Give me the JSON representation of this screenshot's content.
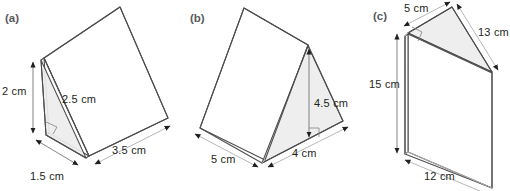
{
  "figure": {
    "background_color": "#ffffff",
    "edge_color": "#4d4d4f",
    "shaded_face_color": "#ededed",
    "label_color": "#231f20",
    "tag_color": "#58595b"
  },
  "panels": [
    {
      "tag": "(a)",
      "solid": "triangular-prism",
      "shaded_face": "left-triangular-end",
      "right_angle": true,
      "labels": [
        {
          "name": "height",
          "text": "2 cm",
          "value": 2,
          "unit": "cm"
        },
        {
          "name": "hypotenuse",
          "text": "2.5 cm",
          "value": 2.5,
          "unit": "cm"
        },
        {
          "name": "base",
          "text": "1.5 cm",
          "value": 1.5,
          "unit": "cm"
        },
        {
          "name": "length",
          "text": "3.5 cm",
          "value": 3.5,
          "unit": "cm"
        }
      ]
    },
    {
      "tag": "(b)",
      "solid": "triangular-prism",
      "shaded_face": "right-triangular-end",
      "right_angle": true,
      "labels": [
        {
          "name": "length",
          "text": "5 cm",
          "value": 5,
          "unit": "cm"
        },
        {
          "name": "perpendicular-height",
          "text": "4.5 cm",
          "value": 4.5,
          "unit": "cm"
        },
        {
          "name": "base",
          "text": "4 cm",
          "value": 4,
          "unit": "cm"
        }
      ]
    },
    {
      "tag": "(c)",
      "solid": "triangular-prism",
      "shaded_face": "top-triangular-end",
      "right_angle": true,
      "labels": [
        {
          "name": "short-leg",
          "text": "5 cm",
          "value": 5,
          "unit": "cm"
        },
        {
          "name": "hypotenuse",
          "text": "13 cm",
          "value": 13,
          "unit": "cm"
        },
        {
          "name": "prism-length",
          "text": "15 cm",
          "value": 15,
          "unit": "cm"
        },
        {
          "name": "long-leg",
          "text": "12 cm",
          "value": 12,
          "unit": "cm"
        }
      ]
    }
  ]
}
